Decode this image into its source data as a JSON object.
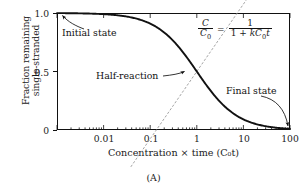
{
  "chart_data": {
    "type": "line",
    "title": "",
    "xlabel": "Concentration × time (C₀t)",
    "ylabel": "Fraction remaining single-stranded",
    "xscale": "log",
    "xlim": [
      0.001,
      100
    ],
    "ylim": [
      0,
      1.0
    ],
    "xtick_labels": [
      "0.01",
      "0.1",
      "1",
      "10",
      "100"
    ],
    "xtick_values": [
      0.01,
      0.1,
      1,
      10,
      100
    ],
    "ytick_labels": [
      "0",
      "0.5",
      "1.0"
    ],
    "ytick_values": [
      0,
      0.5,
      1.0
    ],
    "grid": false,
    "legend": "none",
    "equation_text": "C/C0 = 1 / (1 + k C0 t)",
    "series": [
      {
        "name": "Fraction remaining single-stranded",
        "x": [
          0.001,
          0.002,
          0.005,
          0.01,
          0.02,
          0.05,
          0.1,
          0.2,
          0.3,
          0.5,
          0.7,
          1.0,
          1.5,
          2.0,
          3.0,
          5.0,
          7.0,
          10.0,
          20.0,
          50.0,
          100.0
        ],
        "values": [
          0.999,
          0.998,
          0.995,
          0.99,
          0.98,
          0.95,
          0.909,
          0.833,
          0.769,
          0.667,
          0.588,
          0.5,
          0.4,
          0.333,
          0.25,
          0.167,
          0.125,
          0.091,
          0.048,
          0.02,
          0.01
        ]
      }
    ],
    "annotations": [
      {
        "id": "initial-state",
        "label": "Initial state",
        "points_to_x": 0.0022,
        "points_to_y": 1.0
      },
      {
        "id": "half-reaction",
        "label": "Half-reaction",
        "points_to_x": 1.0,
        "points_to_y": 0.5
      },
      {
        "id": "final-state",
        "label": "Final state",
        "points_to_x": 100,
        "points_to_y": 0.01
      }
    ]
  },
  "axes": {
    "y_title_line1": "Fraction remaining",
    "y_title_line2": "single-stranded",
    "x_title": "Concentration × time (C₀t)",
    "ytick_0": "0",
    "ytick_1": "0.5",
    "ytick_2": "1.0",
    "xtick_0": "0.01",
    "xtick_1": "0.1",
    "xtick_2": "1",
    "xtick_3": "10",
    "xtick_4": "100"
  },
  "annotations": {
    "initial": "Initial state",
    "half": "Half-reaction",
    "final": "Final state"
  },
  "equation": {
    "num_left": "C",
    "den_left": "C",
    "den_left_sub": "0",
    "equals": "=",
    "num_right": "1",
    "den_right_prefix": "1 + ",
    "den_right_k": "k",
    "den_right_c": "C",
    "den_right_sub": "0",
    "den_right_t": "t"
  },
  "caption": {
    "label": "(A)"
  },
  "colors": {
    "curve": "#111111",
    "frame": "#111111",
    "tangent": "#8c8c8c",
    "text": "#1a1a1a",
    "background": "#ffffff"
  }
}
